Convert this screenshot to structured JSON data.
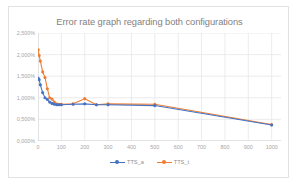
{
  "chart_data": {
    "type": "line",
    "title": "Error rate graph regarding both configurations",
    "xlabel": "",
    "ylabel": "",
    "xlim": [
      0,
      1040
    ],
    "ylim": [
      0,
      2.5
    ],
    "grid": true,
    "legend_position": "bottom",
    "y_tick_labels": [
      "0,000%",
      "0,500%",
      "1,000%",
      "1,500%",
      "2,000%",
      "2,500%"
    ],
    "y_tick_values": [
      0,
      0.5,
      1.0,
      1.5,
      2.0,
      2.5
    ],
    "x_tick_labels": [
      "0",
      "100",
      "200",
      "300",
      "400",
      "500",
      "600",
      "700",
      "800",
      "900",
      "1000"
    ],
    "x_tick_values": [
      0,
      100,
      200,
      300,
      400,
      500,
      600,
      700,
      800,
      900,
      1000
    ],
    "x": [
      1,
      5,
      10,
      20,
      30,
      40,
      50,
      60,
      70,
      80,
      90,
      100,
      150,
      200,
      250,
      300,
      500,
      1000
    ],
    "series": [
      {
        "name": "TTS_a",
        "color": "#4472C4",
        "marker_color": "#4472C4",
        "values": [
          1.45,
          1.42,
          1.3,
          1.12,
          1.0,
          0.96,
          0.9,
          0.87,
          0.85,
          0.84,
          0.84,
          0.84,
          0.85,
          0.86,
          0.84,
          0.84,
          0.82,
          0.37
        ]
      },
      {
        "name": "TTS_t",
        "color": "#ED7D31",
        "marker_color": "#ED7D31",
        "values": [
          2.11,
          1.98,
          1.85,
          1.6,
          1.47,
          1.21,
          1.0,
          0.97,
          0.9,
          0.86,
          0.85,
          0.85,
          0.86,
          0.98,
          0.84,
          0.86,
          0.85,
          0.38
        ]
      }
    ]
  },
  "legend": {
    "entries": [
      {
        "label": "TTS_a"
      },
      {
        "label": "TTS_t"
      }
    ]
  }
}
